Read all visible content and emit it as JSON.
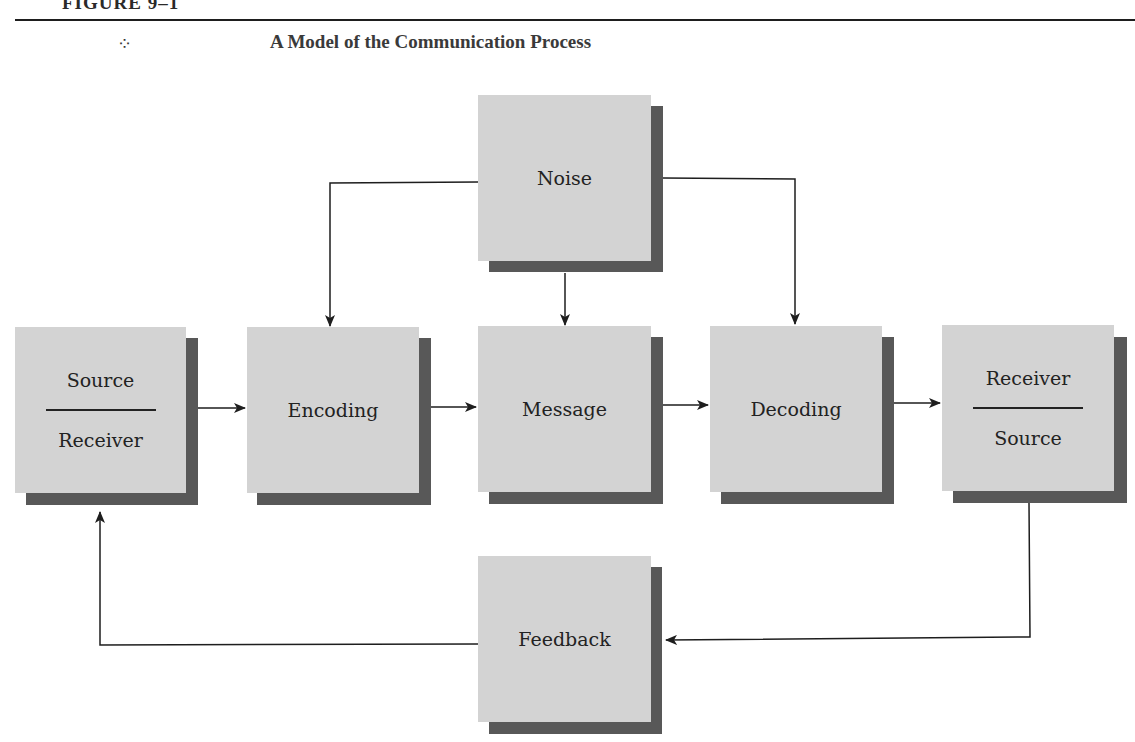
{
  "figure": {
    "label": "FIGURE 9–1",
    "ornament_icon": "diamond-ornament-icon",
    "title": "A Model of the Communication Process"
  },
  "boxes": {
    "source_receiver": {
      "top": "Source",
      "bottom": "Receiver"
    },
    "encoding": {
      "label": "Encoding"
    },
    "message": {
      "label": "Message"
    },
    "decoding": {
      "label": "Decoding"
    },
    "receiver_source": {
      "top": "Receiver",
      "bottom": "Source"
    },
    "noise": {
      "label": "Noise"
    },
    "feedback": {
      "label": "Feedback"
    }
  },
  "colors": {
    "box_fill": "#d3d3d3",
    "box_shadow": "#585858",
    "line": "#1e1e1e"
  }
}
